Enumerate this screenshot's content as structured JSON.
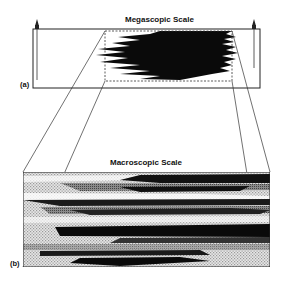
{
  "figure": {
    "panel_a": {
      "label": "(a)",
      "title": "Megascopic Scale",
      "description": "Large rectangular domain with a dashed sub-region containing a dark interfingered lenticular body; well markers at each end"
    },
    "panel_b": {
      "label": "(b)",
      "title": "Macroscopic Scale",
      "description": "Enlarged view of the dashed sub-region showing interbedded lenses in black, gray and light stipple"
    },
    "colors": {
      "line": "#222222",
      "dark_body": "#0a0a0a",
      "mid_gray": "#6e6e6e",
      "light_gray": "#bdbdbd",
      "background": "#ffffff"
    }
  }
}
